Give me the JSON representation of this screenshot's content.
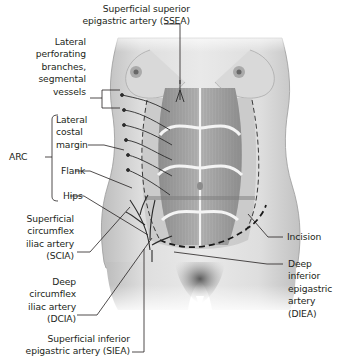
{
  "figure": {
    "labels": {
      "ssea": [
        "Superficial superior",
        "epigastric artery (SSEA)"
      ],
      "perforating": [
        "Lateral",
        "perforating",
        "branches,",
        "segmental",
        "vessels"
      ],
      "lateral_costal": [
        "Lateral",
        "costal",
        "margin"
      ],
      "arc": "ARC",
      "flank": "Flank",
      "hips": "Hips",
      "scia": [
        "Superficial",
        "circumflex",
        "iliac artery",
        "(SCIA)"
      ],
      "dcia": [
        "Deep",
        "circumflex",
        "iliac artery",
        "(DCIA)"
      ],
      "siea": [
        "Superficial inferior",
        "epigastric artery (SIEA)"
      ],
      "incision": "Incision",
      "diea": [
        "Deep",
        "inferior",
        "epigastric",
        "artery",
        "(DIEA)"
      ]
    },
    "colors": {
      "skin_light": "#e6e6e6",
      "skin_mid": "#c9c9c9",
      "muscle": "#9c9c9c",
      "vessel": "#2b2b2b",
      "leader_line": "#231f20",
      "text": "#231f20"
    }
  }
}
